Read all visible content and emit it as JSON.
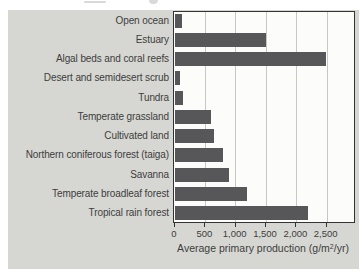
{
  "chart_data": {
    "type": "bar",
    "orientation": "horizontal",
    "categories": [
      "Open ocean",
      "Estuary",
      "Algal beds and coral reefs",
      "Desert and semidesert scrub",
      "Tundra",
      "Temperate grassland",
      "Cultivated land",
      "Northern coniferous forest (taiga)",
      "Savanna",
      "Temperate broadleaf forest",
      "Tropical rain forest"
    ],
    "values": [
      125,
      1500,
      2500,
      90,
      140,
      600,
      650,
      800,
      900,
      1200,
      2200
    ],
    "title": "",
    "xlabel": "Average primary production (g/m²/yr)",
    "xlabel_parts": {
      "pre": "Average primary production (g/m",
      "sup": "2",
      "post": "/yr)"
    },
    "ylabel": "",
    "x_ticks": [
      0,
      500,
      1000,
      1500,
      2000,
      2500
    ],
    "x_tick_labels": [
      "0",
      "500",
      "1,000",
      "1,500",
      "2,000",
      "2,500"
    ],
    "xlim": [
      0,
      2950
    ],
    "grid": "vertical-only",
    "legend": "none",
    "colors": {
      "bar": "#57575a",
      "panel_background": "#d6d7d2",
      "plot_background": "#fcfcfa",
      "gridline": "#c6c8c4",
      "plot_border": "#333333",
      "text": "#3d3d3d"
    }
  }
}
